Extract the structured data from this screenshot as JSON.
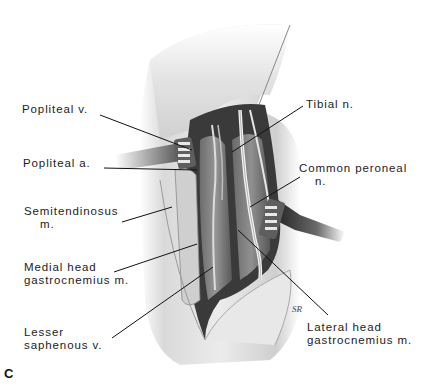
{
  "figure": {
    "panel_letter": "C",
    "labels": [
      {
        "id": "popliteal-v",
        "line1": "Popliteal v.",
        "line2": "",
        "x": 22,
        "y": 109
      },
      {
        "id": "popliteal-a",
        "line1": "Popliteal a.",
        "line2": "",
        "x": 23,
        "y": 162
      },
      {
        "id": "semitendinosus-m",
        "line1": "Semitendinosus",
        "line2": "m.",
        "x": 24,
        "y": 210
      },
      {
        "id": "medial-head-gastrocnemius-m",
        "line1": "Medial head",
        "line2": "gastrocnemius m.",
        "x": 24,
        "y": 266
      },
      {
        "id": "lesser-saphenous-v",
        "line1": "Lesser",
        "line2": "saphenous v.",
        "x": 24,
        "y": 327
      },
      {
        "id": "tibial-n",
        "line1": "Tibial n.",
        "line2": "",
        "x": 306,
        "y": 98
      },
      {
        "id": "common-peroneal-n",
        "line1": "Common peroneal",
        "line2": "n.",
        "x": 299,
        "y": 161
      },
      {
        "id": "lateral-head-gastrocnemius-m",
        "line1": "Lateral head",
        "line2": "gastrocnemius m.",
        "x": 307,
        "y": 318
      }
    ],
    "signature": "SR"
  }
}
